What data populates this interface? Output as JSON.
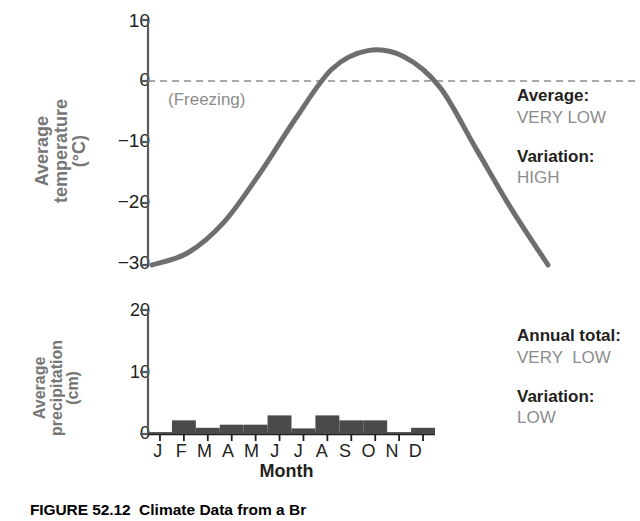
{
  "figure": {
    "caption_number": "FIGURE 52.12",
    "caption_text": "Climate Data from a Br"
  },
  "temperature_panel": {
    "axis_title": "Average\ntemperature\n(°C)",
    "freezing_label": "(Freezing)",
    "annotations": [
      {
        "key": "Average:",
        "value": "VERY LOW"
      },
      {
        "key": "Variation:",
        "value": "HIGH"
      }
    ]
  },
  "precipitation_panel": {
    "axis_title": "Average\nprecipitation\n(cm)",
    "annotations": [
      {
        "key": "Annual total:",
        "value": "VERY  LOW"
      },
      {
        "key": "Variation:",
        "value": "LOW"
      }
    ]
  },
  "x_axis": {
    "title": "Month",
    "tick_labels": [
      "J",
      "F",
      "M",
      "A",
      "M",
      "J",
      "J",
      "A",
      "S",
      "O",
      "N",
      "D"
    ]
  },
  "colors": {
    "curve": "#6e6e6e",
    "bars": "#4a4a4a",
    "axis": "#58595b",
    "axis_title_text": "#767676",
    "annotation_value_text": "#8c8c8c",
    "freezing_line": "#8c8c8c"
  },
  "temp_tick_labels": [
    "10",
    "0",
    "−10",
    "−20",
    "−30"
  ],
  "precip_tick_labels": [
    "20",
    "10",
    "0"
  ],
  "chart_data": [
    {
      "type": "line",
      "title": "Average temperature",
      "xlabel": "Month",
      "ylabel": "Average temperature (°C)",
      "categories": [
        "J",
        "F",
        "M",
        "A",
        "M",
        "J",
        "J",
        "A",
        "S",
        "O",
        "N",
        "D"
      ],
      "values": [
        -30,
        -28,
        -23,
        -15,
        -6,
        2,
        5,
        4,
        -1,
        -11,
        -21,
        -30
      ],
      "ylim": [
        -30,
        10
      ],
      "yticks": [
        10,
        0,
        -10,
        -20,
        -30
      ],
      "grid": false,
      "legend": "none",
      "annotations": [
        {
          "text": "(Freezing)",
          "y": 0,
          "note": "dashed horizontal reference line at 0 °C"
        }
      ]
    },
    {
      "type": "bar",
      "title": "Average precipitation",
      "xlabel": "Month",
      "ylabel": "Average precipitation (cm)",
      "categories": [
        "J",
        "F",
        "M",
        "A",
        "M",
        "J",
        "J",
        "A",
        "S",
        "O",
        "N",
        "D"
      ],
      "values": [
        0.3,
        2.2,
        1.0,
        1.5,
        1.5,
        3.0,
        0.9,
        3.0,
        2.2,
        2.2,
        0.3,
        1.0
      ],
      "ylim": [
        0,
        20
      ],
      "yticks": [
        20,
        10,
        0
      ],
      "grid": false,
      "legend": "none"
    }
  ]
}
